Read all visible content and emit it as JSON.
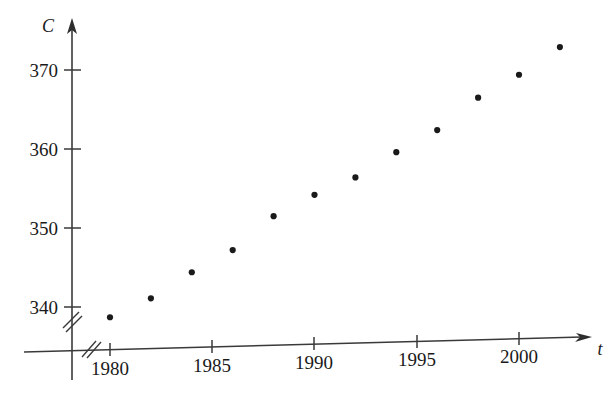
{
  "chart_data": {
    "type": "scatter",
    "title": "",
    "xlabel": "t",
    "ylabel": "C",
    "x": [
      1980,
      1982,
      1984,
      1986,
      1988,
      1990,
      1992,
      1994,
      1996,
      1998,
      2000,
      2002
    ],
    "values": [
      338.7,
      341.1,
      344.4,
      347.2,
      351.5,
      354.2,
      356.4,
      359.6,
      362.4,
      366.5,
      369.4,
      372.9
    ],
    "points": [
      {
        "t": 1980,
        "C": 338.7
      },
      {
        "t": 1982,
        "C": 341.1
      },
      {
        "t": 1984,
        "C": 344.4
      },
      {
        "t": 1986,
        "C": 347.2
      },
      {
        "t": 1988,
        "C": 351.5
      },
      {
        "t": 1990,
        "C": 354.2
      },
      {
        "t": 1992,
        "C": 356.4
      },
      {
        "t": 1994,
        "C": 359.6
      },
      {
        "t": 1996,
        "C": 362.4
      },
      {
        "t": 1998,
        "C": 366.5
      },
      {
        "t": 2000,
        "C": 369.4
      },
      {
        "t": 2002,
        "C": 372.9
      }
    ],
    "xticks": [
      1980,
      1985,
      1990,
      1995,
      2000
    ],
    "xtick_labels": [
      "1980",
      "1985",
      "1990",
      "1995",
      "2000"
    ],
    "yticks": [
      340,
      350,
      360,
      370
    ],
    "ytick_labels": [
      "340",
      "350",
      "360",
      "370"
    ],
    "xlim": [
      1978.2,
      2003.0
    ],
    "ylim": [
      336.0,
      375.5
    ],
    "grid": false,
    "legend": "none",
    "x_axis_break": true,
    "y_axis_break": true,
    "point_color": "#1a1a1a",
    "axis_color": "#3a3a3a"
  },
  "axis": {
    "y_title": "C",
    "x_title": "t"
  }
}
